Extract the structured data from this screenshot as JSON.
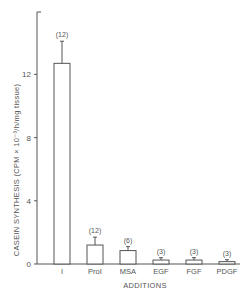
{
  "chart_data": {
    "type": "bar",
    "title": "",
    "xlabel": "ADDITIONS",
    "ylabel": "CASEIN SYNTHESIS (CPM × 10⁻³/h/mg tissue)",
    "ylim": [
      0,
      16
    ],
    "yticks": [
      0,
      4,
      8,
      12
    ],
    "grid": false,
    "legend": null,
    "categories": [
      "I",
      "ProI",
      "MSA",
      "EGF",
      "FGF",
      "PDGF"
    ],
    "values": [
      12.7,
      1.2,
      0.85,
      0.25,
      0.25,
      0.15
    ],
    "errors": [
      1.4,
      0.5,
      0.25,
      0.15,
      0.15,
      0.12
    ],
    "n_labels": [
      "(12)",
      "(12)",
      "(6)",
      "(3)",
      "(3)",
      "(3)"
    ]
  },
  "labels": {
    "xlabel": "ADDITIONS",
    "ylabel": "CASEIN SYNTHESIS (CPM × 10⁻³/h/mg tissue)",
    "categories": [
      "I",
      "ProI",
      "MSA",
      "EGF",
      "FGF",
      "PDGF"
    ],
    "n_labels": [
      "(12)",
      "(12)",
      "(6)",
      "(3)",
      "(3)",
      "(3)"
    ],
    "yticks": [
      "0",
      "4",
      "8",
      "12"
    ]
  },
  "colors": {
    "axis": "#555555",
    "bar_fill": "#ffffff",
    "bar_stroke": "#555555"
  }
}
